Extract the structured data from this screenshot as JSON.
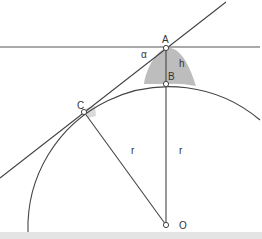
{
  "diagram": {
    "colors": {
      "line": "#444444",
      "shade": "#bdbdbd",
      "point_fill": "#ffffff",
      "label": "#333333",
      "band": "#e4e4e4"
    },
    "points": {
      "A": {
        "label": "A",
        "x": 166,
        "y": 48
      },
      "B": {
        "label": "B",
        "x": 166,
        "y": 84
      },
      "C": {
        "label": "C",
        "x": 84,
        "y": 112
      },
      "O": {
        "label": "O",
        "x": 166,
        "y": 225
      }
    },
    "labels": {
      "alpha": "α",
      "h": "h",
      "r_left": "r",
      "r_right": "r"
    },
    "circle": {
      "center": "O",
      "radius": 141
    },
    "lines": [
      {
        "name": "horizontal-line",
        "from": [
          0,
          47
        ],
        "to": [
          260,
          47
        ]
      },
      {
        "name": "tangent-line",
        "from": [
          0,
          178
        ],
        "to": [
          226,
          2
        ]
      },
      {
        "name": "segment-OA",
        "from": [
          166,
          48
        ],
        "to": [
          166,
          225
        ]
      },
      {
        "name": "segment-OC",
        "from": [
          84,
          112
        ],
        "to": [
          166,
          225
        ]
      }
    ]
  }
}
